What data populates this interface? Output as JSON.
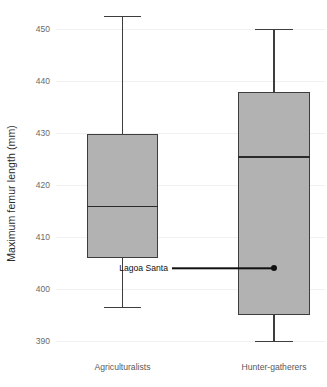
{
  "chart_data": {
    "type": "box",
    "title": "",
    "xlabel": "",
    "ylabel": "Maximum femur length (mm)",
    "ylim": [
      388,
      454
    ],
    "yticks": [
      390,
      400,
      410,
      420,
      430,
      440,
      450
    ],
    "ytick_labels": [
      "390",
      "400",
      "410",
      "420",
      "430",
      "440",
      "450"
    ],
    "grid": true,
    "legend": "none",
    "categories": [
      "Agriculturalists",
      "Hunter-gatherers"
    ],
    "boxes": [
      {
        "name": "Agriculturalists",
        "whisker_low": 396.5,
        "q1": 406.0,
        "median": 416.0,
        "q3": 429.8,
        "whisker_high": 452.5
      },
      {
        "name": "Hunter-gatherers",
        "whisker_low": 390.0,
        "q1": 395.0,
        "median": 425.5,
        "q3": 437.8,
        "whisker_high": 450.0
      }
    ],
    "annotations": [
      {
        "label": "Lagoa Santa",
        "category": "Hunter-gatherers",
        "value": 404.0
      }
    ],
    "colors": {
      "box_fill": "#b2b2b2",
      "box_edge": "#3d3d3d",
      "median": "#2a2a2a",
      "gridline": "#f1f1f1",
      "annotation": "#111111",
      "tick_text": "#6a6a6a",
      "axis_title": "#2b2b2b",
      "background": "#ffffff"
    }
  }
}
